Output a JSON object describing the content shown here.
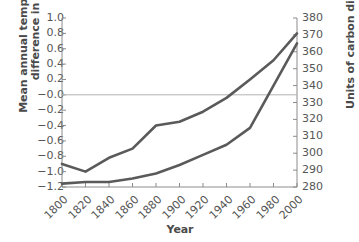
{
  "chart_data": {
    "type": "line",
    "title": "",
    "xlabel": "Year",
    "ylabel_left": "Mean annual temperature\ndifference in °C",
    "ylabel_right": "Units of carbon dioxide",
    "grid": false,
    "legend": "none",
    "x": [
      1800,
      1820,
      1840,
      1860,
      1880,
      1900,
      1920,
      1940,
      1960,
      1980,
      2000
    ],
    "xticklabels": [
      "1800",
      "1820",
      "1840",
      "1860",
      "1880",
      "1900",
      "1920",
      "1940",
      "1960",
      "1980",
      "2000"
    ],
    "xlim": [
      1800,
      2000
    ],
    "ylim_left": [
      -1.2,
      1.0
    ],
    "ylim_right": [
      280,
      380
    ],
    "yticks_left": [
      1.0,
      0.8,
      0.6,
      0.4,
      0.2,
      -0.0,
      -0.2,
      -0.4,
      -0.6,
      -0.8,
      -1.0,
      -1.2
    ],
    "yticklabels_left": [
      "1.0",
      "0.8",
      "0.6",
      "0.4",
      "0.2",
      "−0.0",
      "−0.2",
      "−0.4",
      "−0.6",
      "−0.8",
      "−1.0",
      "−1.2"
    ],
    "yticks_right": [
      380,
      370,
      360,
      350,
      340,
      330,
      320,
      310,
      300,
      290,
      280
    ],
    "yticklabels_right": [
      "380",
      "370",
      "360",
      "350",
      "340",
      "330",
      "320",
      "310",
      "300",
      "290",
      "280"
    ],
    "zero_reference_line": -0.0,
    "series": [
      {
        "name": "Mean annual temperature difference",
        "axis": "left",
        "color": "#5a5a5a",
        "values": [
          -0.9,
          -1.0,
          -0.82,
          -0.7,
          -0.4,
          -0.35,
          -0.22,
          -0.04,
          0.2,
          0.45,
          0.8
        ]
      },
      {
        "name": "Units of carbon dioxide",
        "axis": "right",
        "color": "#5a5a5a",
        "values": [
          282,
          283,
          283,
          285,
          288,
          293,
          299,
          305,
          315,
          340,
          365
        ]
      }
    ]
  },
  "colors": {
    "line": "#5a5a5a",
    "axis": "#8c8c8c",
    "zero_line": "#b4b4b4",
    "text": "#565656",
    "title_text": "#4a4a4a",
    "background": "#ffffff"
  }
}
